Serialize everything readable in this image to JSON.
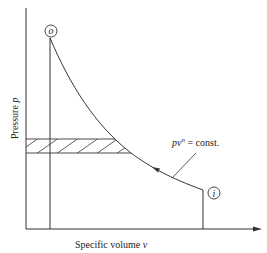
{
  "diagram": {
    "y_axis_label": "Pressure",
    "y_axis_symbol": "p",
    "x_axis_label": "Specific volume",
    "x_axis_symbol": "v",
    "curve_label": "pv",
    "curve_label_exp": "n",
    "curve_label_rest": " = const.",
    "point_initial": "i",
    "point_final": "o",
    "colors": {
      "line": "#333333",
      "background": "#ffffff"
    }
  }
}
